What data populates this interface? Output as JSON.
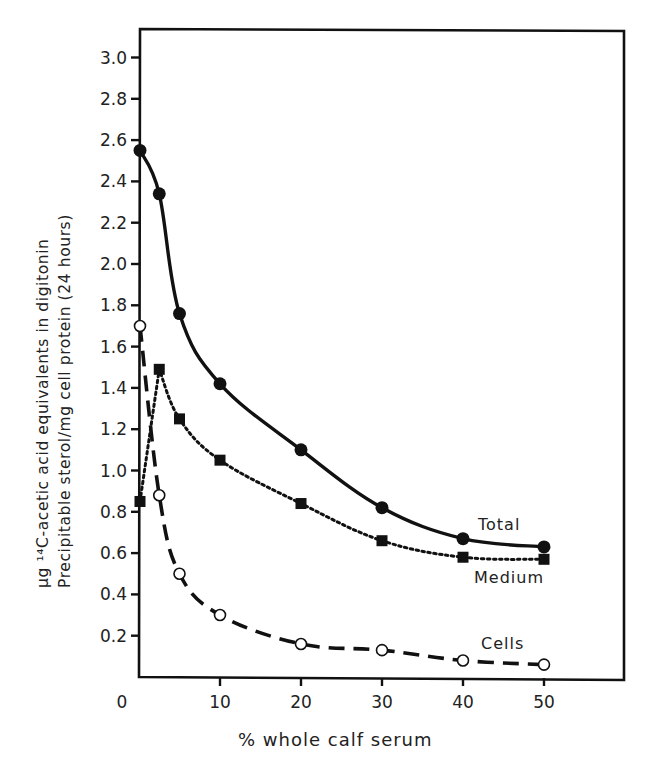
{
  "chart_data": {
    "type": "line",
    "title": "",
    "xlabel": "% whole calf serum",
    "ylabel_line1": "μg ¹⁴C-acetic acid equivalents in digitonin",
    "ylabel_line2": "Precipitable sterol/mg cell protein (24 hours)",
    "xlim": [
      0,
      50
    ],
    "ylim": [
      0,
      3.0
    ],
    "grid": false,
    "legend": "inline labels at right end of each curve",
    "x_ticks": [
      "0",
      "10",
      "20",
      "30",
      "40",
      "50"
    ],
    "y_ticks": [
      "0.2",
      "0.4",
      "0.6",
      "0.8",
      "1.0",
      "1.2",
      "1.4",
      "1.6",
      "1.8",
      "2.0",
      "2.2",
      "2.4",
      "2.6",
      "2.8",
      "3.0"
    ],
    "series": [
      {
        "name": "Total",
        "marker": "filled-circle",
        "line": "solid",
        "x": [
          0,
          2.5,
          5,
          10,
          20,
          30,
          40,
          50
        ],
        "values": [
          2.55,
          2.34,
          1.76,
          1.42,
          1.1,
          0.82,
          0.67,
          0.63
        ]
      },
      {
        "name": "Medium",
        "marker": "filled-square",
        "line": "dotted",
        "x": [
          0,
          2.5,
          5,
          10,
          20,
          30,
          40,
          50
        ],
        "values": [
          0.85,
          1.49,
          1.25,
          1.05,
          0.84,
          0.66,
          0.58,
          0.57
        ]
      },
      {
        "name": "Cells",
        "marker": "open-circle",
        "line": "dashed",
        "x": [
          0,
          2.5,
          5,
          10,
          20,
          30,
          40,
          50
        ],
        "values": [
          1.7,
          0.88,
          0.5,
          0.3,
          0.16,
          0.13,
          0.08,
          0.06
        ]
      }
    ]
  }
}
